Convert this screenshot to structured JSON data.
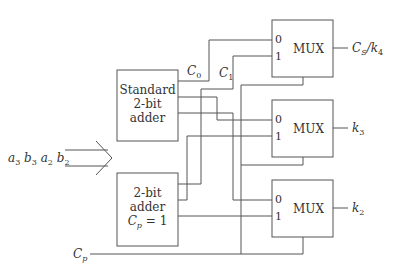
{
  "diagram": {
    "type": "block-diagram",
    "input_bus": {
      "label_parts": [
        [
          "a",
          "3"
        ],
        [
          "b",
          "3"
        ],
        [
          "a",
          "2"
        ],
        [
          "b",
          "2"
        ]
      ]
    },
    "adders": [
      {
        "id": "standard",
        "lines": [
          "Standard",
          "2-bit",
          "adder"
        ]
      },
      {
        "id": "carry1",
        "lines": [
          "2-bit",
          "adder"
        ],
        "carry_label": {
          "var": "C",
          "sub": "p",
          "eq": "= 1"
        }
      }
    ],
    "carry_labels": [
      {
        "var": "C",
        "sub": "0"
      },
      {
        "var": "C",
        "sub": "1"
      }
    ],
    "muxes": [
      {
        "label": "MUX",
        "in0": "0",
        "in1": "1",
        "output": {
          "text": "C",
          "sub": "S",
          "slash": "/k",
          "sub2": "4"
        }
      },
      {
        "label": "MUX",
        "in0": "0",
        "in1": "1",
        "output": {
          "text": "k",
          "sub": "3"
        }
      },
      {
        "label": "MUX",
        "in0": "0",
        "in1": "1",
        "output": {
          "text": "k",
          "sub": "2"
        }
      }
    ],
    "select_signal": {
      "var": "C",
      "sub": "p"
    },
    "colors": {
      "line": "#555555",
      "text": "#333333",
      "background": "#ffffff"
    }
  }
}
